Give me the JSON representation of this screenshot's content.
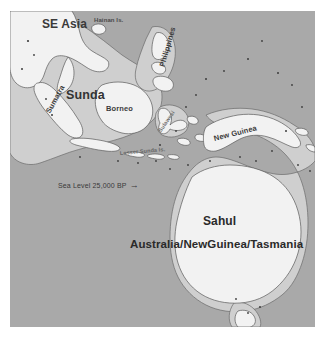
{
  "figure": {
    "type": "paleogeographic-map",
    "width": 325,
    "height": 340
  },
  "colors": {
    "page_background": "#ffffff",
    "ocean": "#a9a9a9",
    "exposed_shelf": "#cfcfcf",
    "land": "#f2f2f2",
    "coastline": "#585858",
    "text": "#2e2e2e"
  },
  "labels": {
    "se_asia": "SE Asia",
    "hainan": "Hainan Is.",
    "philippines": "Philippines",
    "sunda": "Sunda",
    "borneo": "Borneo",
    "sumatra": "Sumatra",
    "sulawesi": "Sulawesi",
    "lesser_sunda": "Lesser Sunda Is.",
    "new_guinea": "New Guinea",
    "sahul": "Sahul",
    "sahul_subtitle": "Australia/NewGuinea/Tasmania"
  },
  "annotation": {
    "sea_level_label": "Sea Level 25,000 BP",
    "arrow_glyph": "→"
  }
}
